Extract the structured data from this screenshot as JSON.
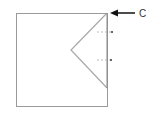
{
  "diagram": {
    "label": "C",
    "colors": {
      "square": "#999999",
      "fold": "#aaaaaa",
      "arrow": "#111111"
    }
  }
}
